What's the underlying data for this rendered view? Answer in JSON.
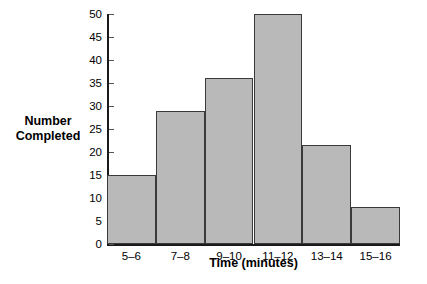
{
  "chart_data": {
    "type": "bar",
    "title": "",
    "subtitle": "",
    "xlabel": "Time (minutes)",
    "ylabel": "Number\nCompleted",
    "categories": [
      "5–6",
      "7–8",
      "9–10",
      "11–12",
      "13–14",
      "15–16"
    ],
    "values": [
      15,
      29,
      36,
      50,
      21.5,
      8
    ],
    "ylim": [
      0,
      50
    ],
    "ytick_labels": [
      "0",
      "5",
      "10",
      "15",
      "20",
      "25",
      "30",
      "35",
      "40",
      "45",
      "50"
    ],
    "ytick_values": [
      0,
      5,
      10,
      15,
      20,
      25,
      30,
      35,
      40,
      45,
      50
    ],
    "grid": false,
    "legend": null,
    "legend_position": "none",
    "bar_fill_color": "#b9b9b9",
    "bar_edge_color": "#3a3a3a",
    "axis_color": "#1a1a1a",
    "background_color": "#ffffff",
    "annotations": []
  }
}
